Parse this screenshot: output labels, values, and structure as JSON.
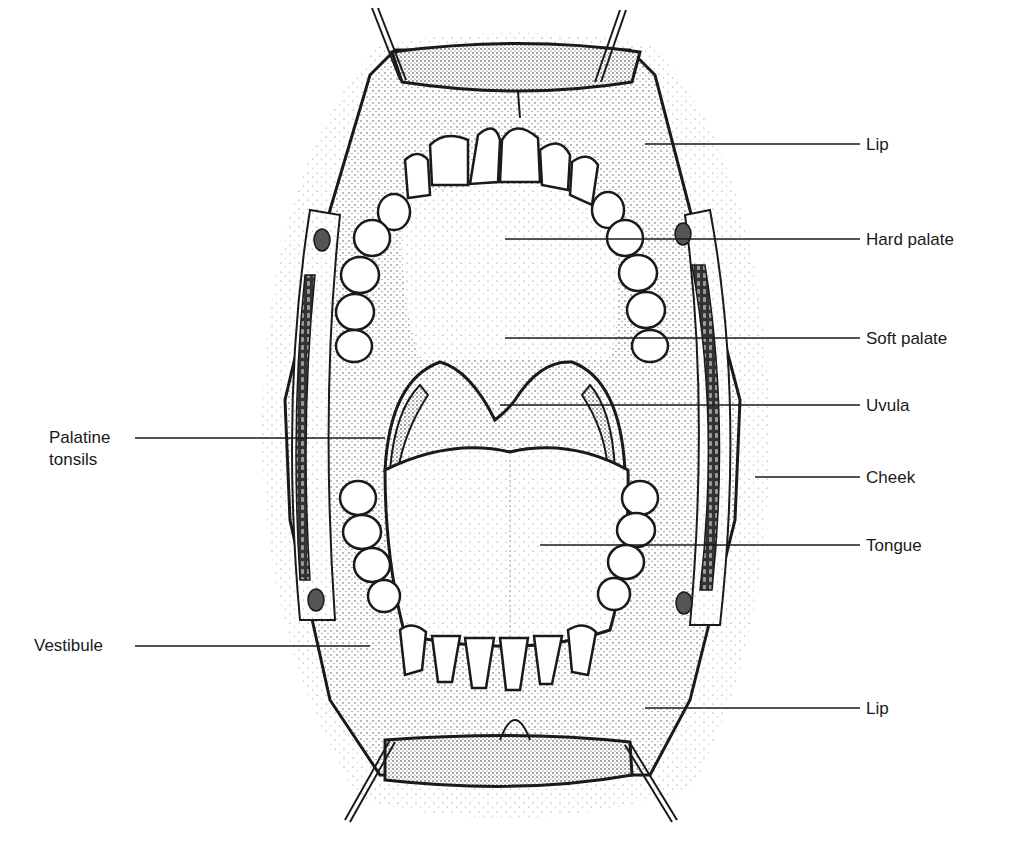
{
  "diagram": {
    "colors": {
      "ink": "#1a1a1a",
      "stipple": "#555555",
      "tooth": "#ffffff",
      "background": "#ffffff"
    },
    "labels": {
      "lip_upper": "Lip",
      "hard_palate": "Hard palate",
      "soft_palate": "Soft palate",
      "uvula": "Uvula",
      "cheek": "Cheek",
      "tongue": "Tongue",
      "lip_lower": "Lip",
      "palatine_tonsils_line1": "Palatine",
      "palatine_tonsils_line2": "tonsils",
      "vestibule": "Vestibule"
    }
  }
}
